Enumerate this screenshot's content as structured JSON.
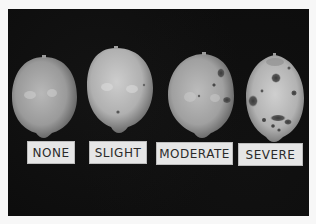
{
  "photo": {
    "description": "Black and white photograph of four lemons on black background showing increasing disease severity",
    "background_color": "#0d0d0d",
    "frame_color": "#f7f7f7"
  },
  "specimens": [
    {
      "label": "NONE"
    },
    {
      "label": "SLIGHT"
    },
    {
      "label": "MODERATE"
    },
    {
      "label": "SEVERE"
    }
  ]
}
